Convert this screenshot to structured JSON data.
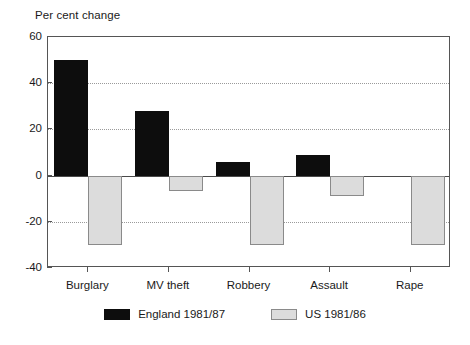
{
  "chart_data": {
    "type": "bar",
    "title": "",
    "ylabel": "Per cent change",
    "xlabel": "",
    "categories": [
      "Burglary",
      "MV theft",
      "Robbery",
      "Assault",
      "Rape"
    ],
    "series": [
      {
        "name": "England 1981/87",
        "color": "#0d0d0d",
        "values": [
          50,
          28,
          6,
          9,
          0
        ]
      },
      {
        "name": "US 1981/86",
        "color": "#dcdcdc",
        "values": [
          -30,
          -6.5,
          -30,
          -9,
          -30
        ]
      }
    ],
    "ylim": [
      -40,
      60
    ],
    "yticks": [
      60,
      40,
      20,
      0,
      -20,
      -40
    ],
    "ytick_labels": [
      "60",
      "40",
      "20",
      "0",
      "-20",
      "-40"
    ],
    "grid": true,
    "gridlines_at": [
      40,
      20,
      -20
    ],
    "zero_line": 0,
    "legend_position": "bottom",
    "legend": [
      {
        "label": "England 1981/87",
        "swatch": "england"
      },
      {
        "label": "US 1981/86",
        "swatch": "us"
      }
    ]
  },
  "axis": {
    "y_title": "Per cent change"
  }
}
